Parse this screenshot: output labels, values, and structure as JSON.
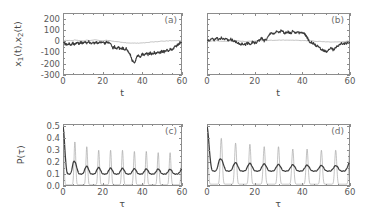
{
  "figure": {
    "background": "#ffffff",
    "axis_color": "#8c8c8c",
    "thin_curve_color": "#9a9a9a",
    "thick_curve_color": "#3c3c3c"
  },
  "panels": [
    {
      "tag": "(a)",
      "xlabel": "t",
      "ylabel_parts": {
        "pre": "x",
        "sub1": "1",
        "mid": "(t),x",
        "sub2": "2",
        "post": "(t)"
      },
      "xticks": [
        "0",
        "20",
        "40",
        "60"
      ],
      "yticks": [
        "200",
        "100",
        "0",
        "-100",
        "-200",
        "-300"
      ],
      "xlim": [
        0,
        60
      ],
      "ylim": [
        -300,
        250
      ],
      "show_ytick_labels": true
    },
    {
      "tag": "(b)",
      "xlabel": "t",
      "xticks": [
        "0",
        "20",
        "40",
        "60"
      ],
      "yticks": [],
      "xlim": [
        0,
        60
      ],
      "ylim": [
        -300,
        250
      ],
      "show_ytick_labels": false
    },
    {
      "tag": "(c)",
      "xlabel": "τ",
      "ylabel": "P(τ)",
      "xticks": [
        "0",
        "20",
        "40",
        "60"
      ],
      "yticks": [
        "0.5",
        "0.4",
        "0.3",
        "0.2",
        "0.1",
        "0.0"
      ],
      "xlim": [
        0,
        60
      ],
      "ylim": [
        0.0,
        0.52
      ],
      "show_ytick_labels": true
    },
    {
      "tag": "(d)",
      "xlabel": "τ",
      "xticks": [
        "0",
        "20",
        "40",
        "60"
      ],
      "yticks": [],
      "xlim": [
        0,
        60
      ],
      "ylim": [
        0.0,
        0.52
      ],
      "show_ytick_labels": false
    }
  ],
  "chart_data": [
    {
      "type": "line",
      "panel": "(a)",
      "title": "",
      "xlabel": "t",
      "ylabel": "x1(t),x2(t)",
      "xlim": [
        0,
        60
      ],
      "ylim": [
        -300,
        250
      ],
      "grid": false,
      "legend": "none",
      "xticks": [
        0,
        20,
        40,
        60
      ],
      "yticks": [
        200,
        100,
        0,
        -100,
        -200,
        -300
      ],
      "series": [
        {
          "name": "x2(t)",
          "style": "thin",
          "color": "#9a9a9a",
          "x": [
            0,
            2,
            4,
            6,
            8,
            10,
            12,
            14,
            16,
            18,
            20,
            22,
            24,
            26,
            28,
            30,
            32,
            34,
            36,
            38,
            40,
            42,
            44,
            46,
            48,
            50,
            52,
            54,
            56,
            58,
            60
          ],
          "y": [
            5,
            8,
            4,
            10,
            6,
            3,
            9,
            5,
            12,
            7,
            4,
            8,
            3,
            -2,
            -6,
            -10,
            -14,
            -16,
            -18,
            -17,
            -15,
            -12,
            -9,
            -6,
            -3,
            0,
            2,
            4,
            3,
            5,
            4
          ]
        },
        {
          "name": "x1(t)",
          "style": "thick",
          "color": "#3c3c3c",
          "x": [
            0,
            1,
            2,
            3,
            4,
            5,
            6,
            7,
            8,
            9,
            10,
            11,
            12,
            13,
            14,
            15,
            16,
            17,
            18,
            19,
            20,
            21,
            22,
            23,
            24,
            25,
            26,
            27,
            28,
            29,
            30,
            31,
            32,
            33,
            34,
            35,
            36,
            37,
            38,
            39,
            40,
            41,
            42,
            43,
            44,
            45,
            46,
            47,
            48,
            49,
            50,
            51,
            52,
            53,
            54,
            55,
            56,
            57,
            58,
            59,
            60
          ],
          "y": [
            0,
            -25,
            -35,
            -20,
            -30,
            -18,
            -28,
            -12,
            -20,
            -10,
            -18,
            -8,
            -15,
            -5,
            -20,
            -12,
            -22,
            -10,
            -18,
            -8,
            -15,
            -20,
            -10,
            -18,
            -25,
            -60,
            -50,
            -70,
            -55,
            -75,
            -58,
            -80,
            -65,
            -90,
            -120,
            -175,
            -190,
            -150,
            -125,
            -135,
            -115,
            -125,
            -110,
            -120,
            -105,
            -115,
            -100,
            -108,
            -95,
            -100,
            -88,
            -95,
            -80,
            -85,
            -70,
            -72,
            -55,
            -45,
            -30,
            -15,
            -5
          ]
        }
      ]
    },
    {
      "type": "line",
      "panel": "(b)",
      "title": "",
      "xlabel": "t",
      "ylabel": "",
      "xlim": [
        0,
        60
      ],
      "ylim": [
        -300,
        250
      ],
      "grid": false,
      "legend": "none",
      "xticks": [
        0,
        20,
        40,
        60
      ],
      "yticks": [],
      "series": [
        {
          "name": "x2(t)",
          "style": "thin",
          "color": "#9a9a9a",
          "x": [
            0,
            4,
            8,
            12,
            16,
            20,
            24,
            28,
            32,
            36,
            40,
            44,
            48,
            52,
            56,
            60
          ],
          "y": [
            0,
            3,
            -2,
            4,
            -3,
            2,
            5,
            8,
            10,
            9,
            6,
            2,
            -4,
            -8,
            -5,
            0
          ]
        },
        {
          "name": "x1(t)",
          "style": "thick",
          "color": "#3c3c3c",
          "x": [
            0,
            1,
            2,
            3,
            4,
            5,
            6,
            7,
            8,
            9,
            10,
            11,
            12,
            13,
            14,
            15,
            16,
            17,
            18,
            19,
            20,
            21,
            22,
            23,
            24,
            25,
            26,
            27,
            28,
            29,
            30,
            31,
            32,
            33,
            34,
            35,
            36,
            37,
            38,
            39,
            40,
            41,
            42,
            43,
            44,
            45,
            46,
            47,
            48,
            49,
            50,
            51,
            52,
            53,
            54,
            55,
            56,
            57,
            58,
            59,
            60
          ],
          "y": [
            0,
            5,
            20,
            10,
            25,
            15,
            30,
            18,
            22,
            12,
            18,
            5,
            -5,
            -18,
            -30,
            -22,
            -32,
            -18,
            -25,
            -10,
            -20,
            -5,
            10,
            25,
            5,
            20,
            55,
            75,
            65,
            85,
            70,
            92,
            80,
            70,
            85,
            72,
            88,
            75,
            85,
            70,
            80,
            62,
            35,
            -5,
            -10,
            -25,
            -40,
            -55,
            -70,
            -85,
            -95,
            -75,
            -60,
            -78,
            -55,
            -40,
            -25,
            -18,
            -22,
            -12,
            -8
          ]
        }
      ]
    },
    {
      "type": "line",
      "panel": "(c)",
      "title": "",
      "xlabel": "τ",
      "ylabel": "P(τ)",
      "xlim": [
        0,
        60
      ],
      "ylim": [
        0.0,
        0.52
      ],
      "grid": false,
      "legend": "none",
      "xticks": [
        0,
        20,
        40,
        60
      ],
      "yticks": [
        0.0,
        0.1,
        0.2,
        0.3,
        0.4,
        0.5
      ],
      "description": "Two oscillating recurrence-probability curves with period about 6; thin curve has tall narrow peaks decaying from 0.50 to 0.30, thick curve has broad smaller peaks decaying from 0.26 to 0.14",
      "series": [
        {
          "name": "P_thin",
          "style": "thin",
          "color": "#9a9a9a",
          "peak_period": 6,
          "peak_positions": [
            0,
            6,
            12,
            18,
            24,
            30,
            36,
            42,
            48,
            54,
            60
          ],
          "peak_values": [
            0.52,
            0.37,
            0.33,
            0.3,
            0.3,
            0.3,
            0.29,
            0.29,
            0.28,
            0.28,
            0.28
          ],
          "trough_value": 0.01
        },
        {
          "name": "P_thick",
          "style": "thick",
          "color": "#3c3c3c",
          "peak_period": 6,
          "peak_positions": [
            0,
            6,
            12,
            18,
            24,
            30,
            36,
            42,
            48,
            54,
            60
          ],
          "peak_values": [
            0.5,
            0.2,
            0.165,
            0.155,
            0.15,
            0.148,
            0.145,
            0.143,
            0.142,
            0.14,
            0.14
          ],
          "trough_value": 0.1
        }
      ]
    },
    {
      "type": "line",
      "panel": "(d)",
      "title": "",
      "xlabel": "τ",
      "ylabel": "",
      "xlim": [
        0,
        60
      ],
      "ylim": [
        0.0,
        0.52
      ],
      "grid": false,
      "legend": "none",
      "xticks": [
        0,
        20,
        40,
        60
      ],
      "yticks": [],
      "description": "Same structure as panel (c); thin curve tall narrow peaks period 6, thick curve broad low-amplitude peaks",
      "series": [
        {
          "name": "P_thin",
          "style": "thin",
          "color": "#9a9a9a",
          "peak_period": 6,
          "peak_positions": [
            0,
            6,
            12,
            18,
            24,
            30,
            36,
            42,
            48,
            54,
            60
          ],
          "peak_values": [
            0.52,
            0.4,
            0.36,
            0.35,
            0.33,
            0.33,
            0.31,
            0.31,
            0.3,
            0.3,
            0.36
          ],
          "trough_value": 0.015
        },
        {
          "name": "P_thick",
          "style": "thick",
          "color": "#3c3c3c",
          "peak_period": 6,
          "peak_positions": [
            0,
            6,
            12,
            18,
            24,
            30,
            36,
            42,
            48,
            54,
            60
          ],
          "peak_values": [
            0.5,
            0.22,
            0.195,
            0.19,
            0.185,
            0.18,
            0.178,
            0.175,
            0.172,
            0.17,
            0.2
          ],
          "trough_value": 0.125
        }
      ]
    }
  ]
}
